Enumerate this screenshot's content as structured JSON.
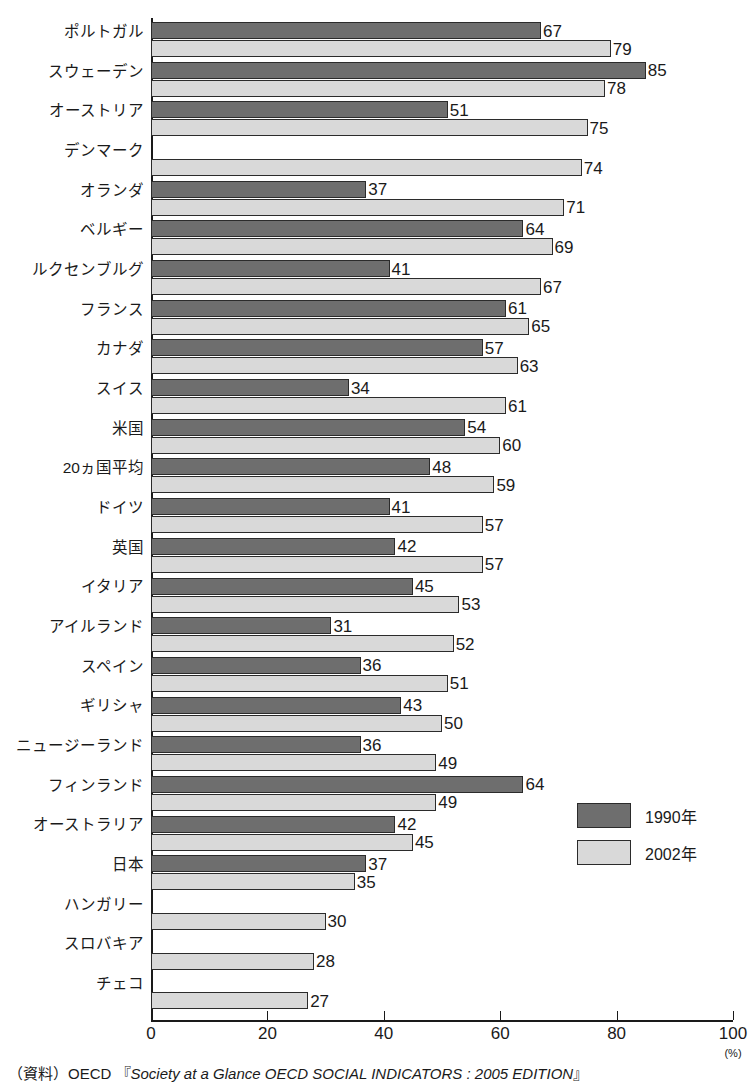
{
  "chart_data": {
    "type": "bar",
    "orientation": "horizontal",
    "title": "",
    "xlabel": "(%)",
    "ylabel": "",
    "xlim": [
      0,
      100
    ],
    "grid": false,
    "legend_position": "bottom-right",
    "categories": [
      "ポルトガル",
      "スウェーデン",
      "オーストリア",
      "デンマーク",
      "オランダ",
      "ベルギー",
      "ルクセンブルグ",
      "フランス",
      "カナダ",
      "スイス",
      "米国",
      "20ヵ国平均",
      "ドイツ",
      "英国",
      "イタリア",
      "アイルランド",
      "スペイン",
      "ギリシャ",
      "ニュージーランド",
      "フィンランド",
      "オーストラリア",
      "日本",
      "ハンガリー",
      "スロバキア",
      "チェコ"
    ],
    "series": [
      {
        "name": "1990年",
        "color": "#6e6e6e",
        "values": [
          67,
          85,
          51,
          null,
          37,
          64,
          41,
          61,
          57,
          34,
          54,
          48,
          41,
          42,
          45,
          31,
          36,
          43,
          36,
          64,
          42,
          37,
          null,
          null,
          null
        ]
      },
      {
        "name": "2002年",
        "color": "#d9d9d9",
        "values": [
          79,
          78,
          75,
          74,
          71,
          69,
          67,
          65,
          63,
          61,
          60,
          59,
          57,
          57,
          53,
          52,
          51,
          50,
          49,
          49,
          45,
          35,
          30,
          28,
          27
        ]
      }
    ],
    "xticks": [
      0,
      20,
      40,
      60,
      80,
      100
    ],
    "xtick_labels": [
      "0",
      "20",
      "40",
      "60",
      "80",
      "100"
    ]
  },
  "legend": {
    "items": [
      {
        "label": "1990年",
        "key": "y1990"
      },
      {
        "label": "2002年",
        "key": "y2002"
      }
    ]
  },
  "axis": {
    "unit_label": "(%)"
  },
  "source": {
    "prefix": "（資料）OECD 『",
    "italic": "Society at a Glance OECD SOCIAL INDICATORS : 2005 EDITION",
    "suffix": "』"
  }
}
